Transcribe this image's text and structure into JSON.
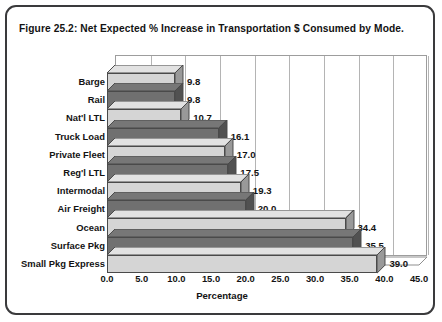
{
  "figure": {
    "title": "Figure 25.2: Net Expected % Increase in Transportation $ Consumed by Mode."
  },
  "chart_data": {
    "type": "bar",
    "orientation": "horizontal",
    "title": "Figure 25.2: Net Expected % Increase in Transportation $ Consumed by Mode.",
    "xlabel": "Percentage",
    "ylabel": "",
    "xlim": [
      0.0,
      45.0
    ],
    "xticks": [
      "0.0",
      "5.0",
      "10.0",
      "15.0",
      "20.0",
      "25.0",
      "30.0",
      "35.0",
      "40.0",
      "45.0"
    ],
    "xtick_values": [
      0,
      5,
      10,
      15,
      20,
      25,
      30,
      35,
      40,
      45
    ],
    "grid": "vertical",
    "legend": "none",
    "style": "3d-bar",
    "categories": [
      "Barge",
      "Rail",
      "Nat'l LTL",
      "Truck Load",
      "Private Fleet",
      "Reg'l LTL",
      "Intermodal",
      "Air Freight",
      "Ocean",
      "Surface Pkg",
      "Small Pkg Express"
    ],
    "values": [
      9.8,
      9.8,
      10.7,
      16.1,
      17.0,
      17.5,
      19.3,
      20.0,
      34.4,
      35.5,
      39.0
    ],
    "value_labels": [
      "9.8",
      "9.8",
      "10.7",
      "16.1",
      "17.0",
      "17.5",
      "19.3",
      "20.0",
      "34.4",
      "35.5",
      "39.0"
    ],
    "bar_colors": [
      "#d5d5d5",
      "#707070"
    ],
    "bar_color_pattern": "alternating light/dark gray"
  }
}
